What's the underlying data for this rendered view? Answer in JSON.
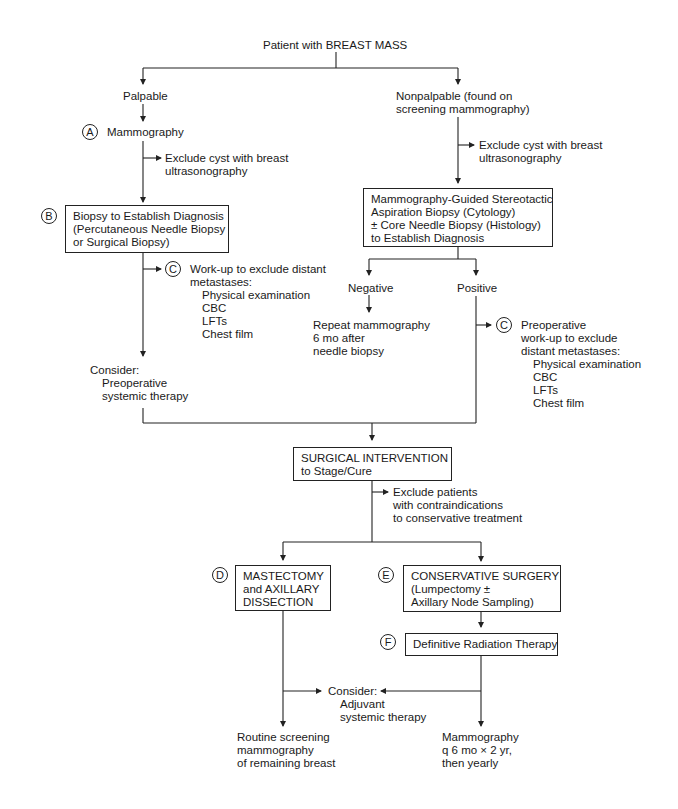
{
  "root": "Patient with BREAST MASS",
  "palpable": {
    "label": "Palpable",
    "step_a": {
      "marker": "A",
      "label": "Mammography"
    },
    "exclude_cyst": [
      "Exclude cyst with breast",
      "ultrasonography"
    ],
    "step_b": {
      "marker": "B",
      "lines": [
        "Biopsy to Establish Diagnosis",
        "(Percutaneous Needle Biopsy",
        "or Surgical Biopsy)"
      ]
    },
    "step_c": {
      "marker": "C",
      "lines": [
        "Work-up to exclude distant",
        "metastases:"
      ],
      "items": [
        "Physical examination",
        "CBC",
        "LFTs",
        "Chest film"
      ]
    },
    "consider": {
      "title": "Consider:",
      "items": [
        "Preoperative",
        "systemic therapy"
      ]
    }
  },
  "nonpalpable": {
    "label_lines": [
      "Nonpalpable (found on",
      "screening mammography)"
    ],
    "exclude_cyst": [
      "Exclude cyst with breast",
      "ultrasonography"
    ],
    "biopsy_box": [
      "Mammography-Guided Stereotactic",
      "Aspiration Biopsy (Cytology)",
      "± Core Needle Biopsy (Histology)",
      "to Establish Diagnosis"
    ],
    "negative": {
      "label": "Negative",
      "result": [
        "Repeat mammography",
        "6 mo after",
        "needle biopsy"
      ]
    },
    "positive": {
      "label": "Positive"
    },
    "step_c": {
      "marker": "C",
      "lines": [
        "Preoperative",
        "work-up to exclude",
        "distant metastases:"
      ],
      "items": [
        "Physical examination",
        "CBC",
        "LFTs",
        "Chest film"
      ]
    }
  },
  "surgical": {
    "lines": [
      "SURGICAL INTERVENTION",
      "to Stage/Cure"
    ],
    "exclude": [
      "Exclude patients",
      "with contraindications",
      "to conservative treatment"
    ]
  },
  "step_d": {
    "marker": "D",
    "lines": [
      "MASTECTOMY",
      "and AXILLARY",
      "DISSECTION"
    ],
    "followup": [
      "Routine screening",
      "mammography",
      "of remaining breast"
    ]
  },
  "step_e": {
    "marker": "E",
    "lines": [
      "CONSERVATIVE SURGERY",
      "(Lumpectomy ±",
      "Axillary Node Sampling)"
    ]
  },
  "step_f": {
    "marker": "F",
    "label": "Definitive Radiation Therapy",
    "followup": [
      "Mammography",
      "q 6 mo × 2 yr,",
      "then yearly"
    ]
  },
  "adjuvant": {
    "title": "Consider:",
    "items": [
      "Adjuvant",
      "systemic therapy"
    ]
  }
}
